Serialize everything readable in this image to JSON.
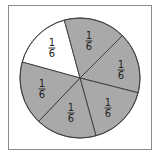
{
  "chart_data": {
    "type": "pie",
    "title": "",
    "center": [
      80,
      78
    ],
    "radius": 60,
    "colors": {
      "shaded": "#a9a9a9",
      "unshaded": "#ffffff",
      "stroke": "#3a3a3a",
      "frame": "#8a8a8a"
    },
    "slices": [
      {
        "label_num": "1",
        "label_den": "6",
        "value": 0.1667,
        "shaded": false,
        "start": [
          22,
          62
        ],
        "end": [
          64,
          19
        ],
        "label_pos": [
          52,
          48
        ]
      },
      {
        "label_num": "1",
        "label_den": "6",
        "value": 0.1667,
        "shaded": true,
        "start": [
          64,
          19
        ],
        "end": [
          122,
          36
        ],
        "label_pos": [
          89,
          41
        ]
      },
      {
        "label_num": "1",
        "label_den": "6",
        "value": 0.1667,
        "shaded": true,
        "start": [
          122,
          36
        ],
        "end": [
          139,
          93
        ],
        "label_pos": [
          121,
          70
        ]
      },
      {
        "label_num": "1",
        "label_den": "6",
        "value": 0.1667,
        "shaded": true,
        "start": [
          139,
          93
        ],
        "end": [
          96,
          136
        ],
        "label_pos": [
          108,
          108
        ]
      },
      {
        "label_num": "1",
        "label_den": "6",
        "value": 0.1667,
        "shaded": true,
        "start": [
          96,
          136
        ],
        "end": [
          39,
          121
        ],
        "label_pos": [
          71,
          113
        ]
      },
      {
        "label_num": "1",
        "label_den": "6",
        "value": 0.1667,
        "shaded": true,
        "start": [
          39,
          121
        ],
        "end": [
          22,
          62
        ],
        "label_pos": [
          42,
          89
        ]
      }
    ],
    "shaded_fraction": "5/6",
    "unshaded_fraction": "1/6"
  }
}
